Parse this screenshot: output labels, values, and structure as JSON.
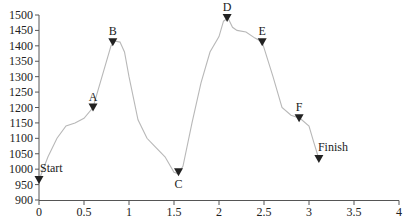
{
  "chart_data": {
    "type": "line",
    "title": "",
    "xlabel": "",
    "ylabel": "",
    "xlim": [
      0,
      4
    ],
    "ylim": [
      900,
      1500
    ],
    "grid": false,
    "legend": null,
    "x_ticks": [
      "0",
      "0.5",
      "1",
      "1.5",
      "2",
      "2.5",
      "3",
      "3.5",
      "4"
    ],
    "y_ticks": [
      "900",
      "950",
      "1000",
      "1050",
      "1100",
      "1150",
      "1200",
      "1250",
      "1300",
      "1350",
      "1400",
      "1450",
      "1500"
    ],
    "series": [
      {
        "name": "elevation profile",
        "color": "#b8b8b8",
        "x": [
          0.0,
          0.1,
          0.2,
          0.3,
          0.4,
          0.5,
          0.6,
          0.7,
          0.8,
          0.85,
          0.9,
          0.95,
          1.0,
          1.1,
          1.2,
          1.3,
          1.4,
          1.5,
          1.55,
          1.6,
          1.7,
          1.8,
          1.9,
          2.0,
          2.05,
          2.1,
          2.15,
          2.2,
          2.3,
          2.4,
          2.48,
          2.6,
          2.7,
          2.8,
          2.9,
          3.0,
          3.05,
          3.11
        ],
        "y": [
          965,
          1040,
          1100,
          1140,
          1150,
          1165,
          1200,
          1300,
          1400,
          1415,
          1412,
          1380,
          1300,
          1160,
          1100,
          1070,
          1040,
          990,
          985,
          1010,
          1150,
          1280,
          1380,
          1430,
          1480,
          1490,
          1460,
          1450,
          1445,
          1425,
          1412,
          1300,
          1200,
          1175,
          1165,
          1140,
          1090,
          1033
        ]
      }
    ],
    "annotations": [
      {
        "label": "Start",
        "x": 0.0,
        "y": 965
      },
      {
        "label": "A",
        "x": 0.6,
        "y": 1200
      },
      {
        "label": "B",
        "x": 0.82,
        "y": 1412
      },
      {
        "label": "C",
        "x": 1.55,
        "y": 990
      },
      {
        "label": "D",
        "x": 2.09,
        "y": 1490
      },
      {
        "label": "E",
        "x": 2.48,
        "y": 1412
      },
      {
        "label": "F",
        "x": 2.89,
        "y": 1165
      },
      {
        "label": "Finish",
        "x": 3.11,
        "y": 1033
      }
    ]
  }
}
